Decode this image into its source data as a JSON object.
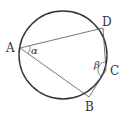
{
  "diagram": {
    "type": "inscribed-quadrilateral",
    "circle": {
      "cx": 63,
      "cy": 55,
      "r": 44,
      "stroke": "#333333"
    },
    "points": {
      "A": {
        "x": 20,
        "y": 48,
        "label": "A"
      },
      "B": {
        "x": 89,
        "y": 97,
        "label": "B"
      },
      "C": {
        "x": 106,
        "y": 70,
        "label": "C"
      },
      "D": {
        "x": 103,
        "y": 28,
        "label": "D"
      }
    },
    "segments": [
      "AD",
      "AB",
      "DC",
      "CB"
    ],
    "angles": {
      "alpha": {
        "vertex": "A",
        "label": "α"
      },
      "beta": {
        "vertex": "C",
        "label": "β"
      }
    },
    "line_color": "#555555"
  }
}
